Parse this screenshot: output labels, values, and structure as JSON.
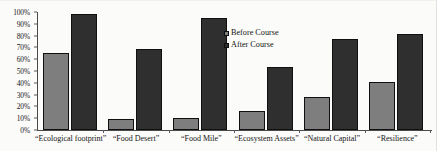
{
  "chart_data": {
    "type": "bar",
    "title": "",
    "xlabel": "",
    "ylabel": "",
    "ylim": [
      0,
      100
    ],
    "ytick_labels": [
      "100%",
      "90%",
      "80%",
      "70%",
      "60%",
      "50%",
      "40%",
      "30%",
      "20%",
      "10%",
      "0%"
    ],
    "ytick_values": [
      100,
      90,
      80,
      70,
      60,
      50,
      40,
      30,
      20,
      10,
      0
    ],
    "grid": false,
    "legend_position": "center-right-inside",
    "categories": [
      "“Ecological footprint”",
      "“Food Desert”",
      "“Food Mile”",
      "“Ecosystem Assets”",
      "“Natural Capital”",
      "“Resilience”"
    ],
    "series": [
      {
        "name": "Before Course",
        "color": "#7e7e7e",
        "values": [
          65,
          9,
          10,
          16,
          28,
          41
        ]
      },
      {
        "name": "After Course",
        "color": "#2f2f2f",
        "values": [
          98,
          69,
          95,
          53,
          77,
          81
        ]
      }
    ]
  }
}
